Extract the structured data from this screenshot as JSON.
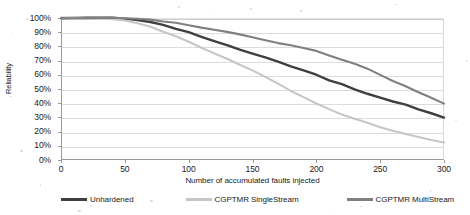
{
  "chart_data": {
    "type": "line",
    "title": "",
    "subtitle": "",
    "xlabel": "Number of accumulated faults injected",
    "ylabel": "Reliability",
    "xlim": [
      0,
      300
    ],
    "ylim": [
      0,
      1
    ],
    "grid": true,
    "legend_position": "bottom",
    "x_ticks": [
      0,
      50,
      100,
      150,
      200,
      250,
      300
    ],
    "x_tick_labels": [
      "0",
      "50",
      "100",
      "150",
      "200",
      "250",
      "300"
    ],
    "y_ticks": [
      0,
      10,
      20,
      30,
      40,
      50,
      60,
      70,
      80,
      90,
      100
    ],
    "y_tick_labels": [
      "0%",
      "10%",
      "20%",
      "30%",
      "40%",
      "50%",
      "60%",
      "70%",
      "80%",
      "90%",
      "100%"
    ],
    "x": [
      0,
      10,
      20,
      30,
      40,
      50,
      60,
      70,
      80,
      90,
      100,
      110,
      120,
      130,
      140,
      150,
      160,
      170,
      180,
      190,
      200,
      210,
      220,
      230,
      240,
      250,
      260,
      270,
      280,
      290,
      300
    ],
    "series": [
      {
        "name": "Unhardened",
        "color": "#3f3f3f",
        "values": [
          100,
          100,
          100,
          100,
          100,
          99.5,
          98.5,
          97,
          95,
          92.5,
          90,
          87,
          84,
          81,
          78,
          75,
          72,
          69,
          66,
          63,
          60,
          56,
          53,
          50,
          47,
          44,
          41.5,
          39,
          36,
          33,
          30
        ]
      },
      {
        "name": "CGPTMR SingleStream",
        "color": "#c6c6c6",
        "values": [
          100,
          100,
          100,
          100,
          99.5,
          98.5,
          96.5,
          94,
          90.5,
          87,
          83,
          79,
          75,
          71,
          67,
          63,
          58.5,
          54,
          49,
          44.5,
          40,
          36,
          32,
          29,
          26,
          23,
          20.5,
          18,
          16,
          14,
          12
        ]
      },
      {
        "name": "CGPTMR MultiStream",
        "color": "#808080",
        "values": [
          100,
          100,
          100,
          100,
          100,
          99.8,
          99.3,
          98.5,
          97.5,
          96.3,
          95,
          93.5,
          92,
          90.3,
          88.5,
          86.5,
          84.5,
          82.5,
          80.5,
          78.5,
          76.5,
          73.5,
          70.5,
          67.5,
          64,
          60,
          56,
          52,
          48,
          44,
          40
        ]
      }
    ]
  },
  "axes": {
    "y_title": "Reliability",
    "x_title": "Number of accumulated faults injected"
  },
  "legend": {
    "items": [
      {
        "label": "Unhardened",
        "color": "#3f3f3f"
      },
      {
        "label": "CGPTMR SingleStream",
        "color": "#c6c6c6"
      },
      {
        "label": "CGPTMR MultiStream",
        "color": "#808080"
      }
    ]
  }
}
